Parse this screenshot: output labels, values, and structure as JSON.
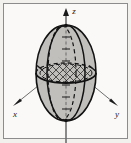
{
  "figure": {
    "caption": "",
    "frame": {
      "border_color": "#8c8c8c",
      "background_color": "#f2f1ee",
      "inner_background_color": "#faf9f7"
    },
    "axes": [
      {
        "id": "x",
        "label": "x",
        "direction": "lower-left",
        "arrow": true
      },
      {
        "id": "y",
        "label": "y",
        "direction": "lower-right",
        "arrow": true
      },
      {
        "id": "z",
        "label": "z",
        "direction": "up",
        "arrow": true
      }
    ],
    "solid": {
      "name": "ellipsoid",
      "shape": "prolate-spheroid",
      "fill_color": "#bdbcb8",
      "outline_color": "#121212",
      "outline_style": "solid"
    },
    "curves": [
      {
        "name": "equator-front",
        "style": "solid",
        "color": "#121212",
        "description": "front half of equatorial ellipse"
      },
      {
        "name": "equator-back",
        "style": "dashed",
        "color": "#121212",
        "description": "back half of equatorial ellipse"
      },
      {
        "name": "meridian-front",
        "style": "solid",
        "color": "#121212",
        "description": "vertical great circle seen edge-on as ellipse"
      },
      {
        "name": "meridian-back",
        "style": "dashed",
        "color": "#121212",
        "description": "hidden half of vertical great circle"
      }
    ],
    "hatched_region": {
      "name": "cross-hatched-disk",
      "pattern": "cross-hatch",
      "color": "#1a1a1a",
      "description": "cross-hatched elliptical disk at the center of the ellipsoid"
    },
    "tick_marks": {
      "z_axis_ticks": 7,
      "x_axis_ticks": 1,
      "y_axis_ticks": 1,
      "color": "#1a1a1a"
    }
  }
}
